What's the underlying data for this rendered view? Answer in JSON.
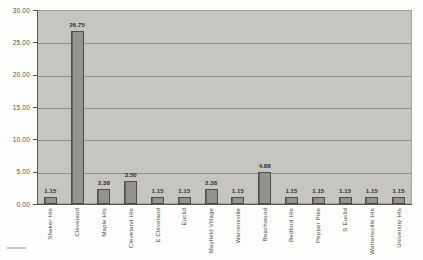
{
  "chart_data": {
    "type": "bar",
    "title": "",
    "xlabel": "",
    "ylabel": "",
    "categories": [
      "Shaker Hts",
      "Cleveland",
      "Maple Hts",
      "Cleveland Hts",
      "E Cleveland",
      "Euclid",
      "Mayfield Village",
      "Warrensville",
      "Beachwood",
      "Bedford Hts",
      "Pepper Pike",
      "S Euclid",
      "Warrensville Hts",
      "University Hts"
    ],
    "values": [
      1.15,
      26.75,
      2.38,
      3.5,
      1.15,
      1.15,
      2.38,
      1.15,
      4.88,
      1.15,
      1.15,
      1.15,
      1.15,
      1.15
    ],
    "value_labels": [
      "1.15",
      "26.75",
      "2.38",
      "3.50",
      "1.15",
      "1.15",
      "2.38",
      "1.15",
      "4.88",
      "1.15",
      "1.15",
      "1.15",
      "1.15",
      "1.15"
    ],
    "ylim": [
      0,
      30
    ],
    "ytick_step": 5,
    "ytick_labels": [
      "30.00",
      "25.00",
      "20.00",
      "15.00",
      "10.00",
      "5.00",
      "0.00"
    ],
    "grid": true,
    "legend": false,
    "colors": {
      "figure_bg": "#fdfdfc",
      "plot_bg": "#c7c5c0",
      "gridline": "#918f8b",
      "axis_line": "#55544f",
      "bar_fill": "#94928d",
      "bar_border": "#4e4d49",
      "value_label_text": "#2e2d2a",
      "tick_label_text": "#55544f",
      "category_label_text": "#4a4944"
    },
    "layout": {
      "plot_left": 37,
      "plot_top": 10,
      "plot_width": 375,
      "plot_height": 194,
      "bar_width": 13,
      "x_label_top": 208
    }
  }
}
